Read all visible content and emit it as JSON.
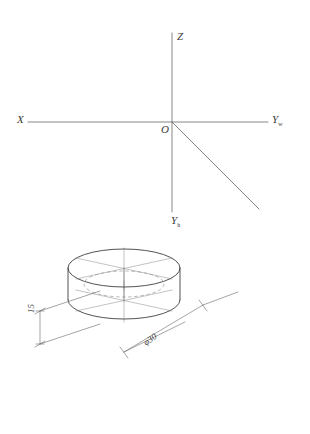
{
  "drawing": {
    "title": "Axonometric axes with isometric cylinder",
    "background_color": "#ffffff",
    "outline_color": "#444444",
    "construction_color": "#999999",
    "hidden_line_color": "#8a8a8a",
    "text_color": "#3a3a3a"
  },
  "axes": {
    "z_label": "Z",
    "x_label": "X",
    "y_w_label": "Y",
    "y_w_subscript": "w",
    "y_h_label": "Y",
    "y_h_subscript": "h",
    "origin_label": "O"
  },
  "cylinder": {
    "dimensions": [
      {
        "name": "height",
        "text": "15",
        "value": 15
      },
      {
        "name": "diameter",
        "text": "φ30",
        "symbol": "φ",
        "value": 30
      }
    ]
  }
}
